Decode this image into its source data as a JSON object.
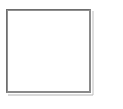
{
  "page": {
    "background_color": "#ffffff",
    "width": 123,
    "height": 109
  },
  "placeholder_box": {
    "label": "",
    "content": "",
    "border_color": "#6e6e6e",
    "shadow_color": "#b9b9b9",
    "fill_color": "#ffffff",
    "x": 6,
    "y": 9,
    "width": 87,
    "height": 86
  }
}
